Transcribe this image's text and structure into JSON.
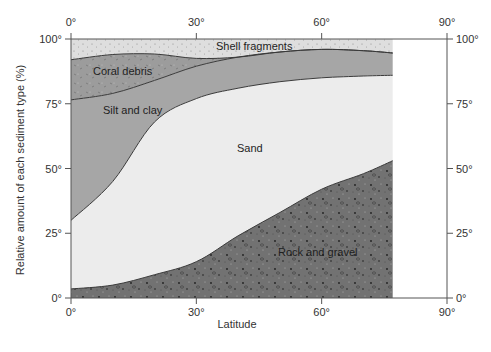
{
  "chart_data": {
    "type": "area",
    "subtype": "stacked_area_100_percent",
    "title": "",
    "xlabel": "Latitude",
    "ylabel": "Relative amount of each sediment type (%)",
    "xlim": [
      0,
      90
    ],
    "ylim": [
      0,
      100
    ],
    "x_ticks": [
      "0°",
      "30°",
      "60°",
      "90°"
    ],
    "y_ticks_left": [
      "0°",
      "25°",
      "50°",
      "75°",
      "100°"
    ],
    "y_ticks_right": [
      "0°",
      "25°",
      "50°",
      "75°",
      "100°"
    ],
    "x_ticks_top": [
      "0°",
      "30°",
      "60°",
      "90°"
    ],
    "grid": false,
    "legend": "none (regions labeled inline)",
    "data_extent_x": [
      0,
      77
    ],
    "x": [
      0,
      10,
      20,
      30,
      40,
      50,
      60,
      70,
      77
    ],
    "boundaries_cumulative_percent": {
      "rock_and_gravel_top": [
        3.5,
        5,
        9,
        14,
        24,
        33,
        42,
        48,
        53
      ],
      "sand_top": [
        30,
        45,
        68,
        77,
        81,
        83.5,
        85,
        85.7,
        86
      ],
      "silt_and_clay_top": [
        76.5,
        79,
        84,
        89.5,
        93,
        95,
        96,
        95.5,
        94.6
      ],
      "coral_debris_top": [
        92,
        94,
        94.2,
        92.5,
        93,
        95,
        96,
        95.5,
        94.6
      ],
      "shell_fragments_top": [
        100,
        100,
        100,
        100,
        100,
        100,
        100,
        100,
        100
      ]
    },
    "series": [
      {
        "name": "Rock and gravel",
        "values": [
          3.5,
          5,
          9,
          14,
          24,
          33,
          42,
          48,
          53
        ]
      },
      {
        "name": "Sand",
        "values": [
          26.5,
          40,
          59,
          63,
          57,
          50.5,
          43,
          37.7,
          33
        ]
      },
      {
        "name": "Silt and clay",
        "values": [
          46.5,
          34,
          16,
          12.5,
          12,
          11.5,
          11,
          9.8,
          8.6
        ]
      },
      {
        "name": "Coral debris",
        "values": [
          15.5,
          15,
          10.2,
          3,
          0,
          0,
          0,
          0,
          0
        ]
      },
      {
        "name": "Shell fragments",
        "values": [
          8,
          6,
          5.8,
          7.5,
          7,
          5,
          4,
          4.5,
          5.4
        ]
      }
    ],
    "region_labels": [
      "Shell fragments",
      "Coral debris",
      "Silt and clay",
      "Sand",
      "Rock and gravel"
    ]
  },
  "labels": {
    "shell": "Shell fragments",
    "coral": "Coral debris",
    "silt": "Silt and clay",
    "sand": "Sand",
    "rock": "Rock and gravel",
    "xlabel": "Latitude",
    "ylabel": "Relative amount of each sediment type (%)"
  },
  "colors": {
    "shell": "#dcdcdc",
    "coral": "#9a9a9a",
    "silt": "#a6a6a6",
    "sand": "#ececec",
    "rock": "#6f6f6f",
    "line": "#3a3a3a",
    "axis": "#555555"
  }
}
